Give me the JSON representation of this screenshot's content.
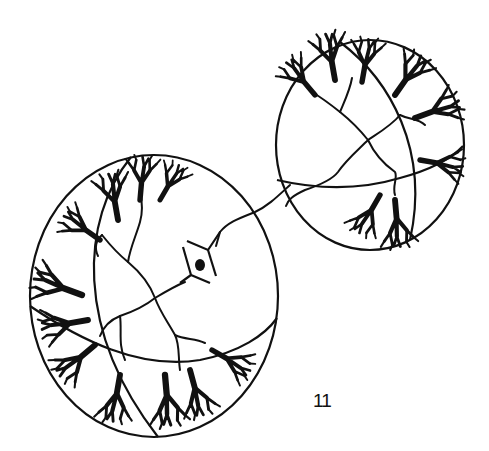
{
  "figure": {
    "label": "11",
    "colors": {
      "ink": "#111111",
      "background": "#ffffff"
    },
    "spheres": [
      {
        "id": "left",
        "cx": 154,
        "cy": 296,
        "rx": 124,
        "ry": 141,
        "has_symbol": true
      },
      {
        "id": "right",
        "cx": 370,
        "cy": 145,
        "rx": 94,
        "ry": 105,
        "has_symbol": false
      }
    ],
    "center_symbol": "eye-in-rhombus"
  }
}
